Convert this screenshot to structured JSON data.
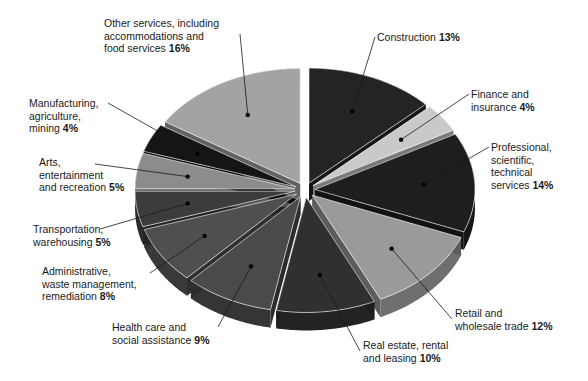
{
  "chart_data": {
    "type": "pie",
    "title": "",
    "style": "exploded 3D pie",
    "start_angle_deg": 0,
    "direction": "clockwise",
    "slices": [
      {
        "label": "Construction",
        "value": 13,
        "color": "#242424"
      },
      {
        "label": "Finance and insurance",
        "value": 4,
        "color": "#c9c9c9"
      },
      {
        "label": "Professional, scientific, technical services",
        "value": 14,
        "color": "#1e1e1e"
      },
      {
        "label": "Retail and wholesale trade",
        "value": 12,
        "color": "#9a9a9a"
      },
      {
        "label": "Real estate, rental and leasing",
        "value": 10,
        "color": "#303030"
      },
      {
        "label": "Health care and social assistance",
        "value": 9,
        "color": "#4a4a4a"
      },
      {
        "label": "Administrative, waste management, remediation",
        "value": 8,
        "color": "#4f4f4f"
      },
      {
        "label": "Transportation, warehousing",
        "value": 5,
        "color": "#3c3c3c"
      },
      {
        "label": "Arts, entertainment and recreation",
        "value": 5,
        "color": "#8c8c8c"
      },
      {
        "label": "Manufacturing, agriculture, mining",
        "value": 4,
        "color": "#151515"
      },
      {
        "label": "Other services, including accommodations and food services",
        "value": 16,
        "color": "#a3a3a3"
      }
    ],
    "unit": "%"
  },
  "labels": {
    "construction": {
      "lines": [
        "Construction"
      ],
      "pct": "13%"
    },
    "finance": {
      "lines": [
        "Finance and",
        "insurance"
      ],
      "pct": "4%"
    },
    "professional": {
      "lines": [
        "Professional,",
        "scientific,",
        "technical",
        "services"
      ],
      "pct": "14%"
    },
    "retail": {
      "lines": [
        "Retail and",
        "wholesale trade"
      ],
      "pct": "12%"
    },
    "realestate": {
      "lines": [
        "Real estate, rental",
        "and leasing"
      ],
      "pct": "10%"
    },
    "health": {
      "lines": [
        "Health care and",
        "social assistance"
      ],
      "pct": "9%"
    },
    "admin": {
      "lines": [
        "Administrative,",
        "waste management,",
        "remediation"
      ],
      "pct": "8%"
    },
    "transport": {
      "lines": [
        "Transportation,",
        "warehousing"
      ],
      "pct": "5%"
    },
    "arts": {
      "lines": [
        "Arts,",
        "entertainment",
        "and recreation"
      ],
      "pct": "5%"
    },
    "manufacturing": {
      "lines": [
        "Manufacturing,",
        "agriculture,",
        "mining"
      ],
      "pct": "4%"
    },
    "other": {
      "lines": [
        "Other services, including",
        "accommodations and",
        "food services"
      ],
      "pct": "16%"
    }
  }
}
